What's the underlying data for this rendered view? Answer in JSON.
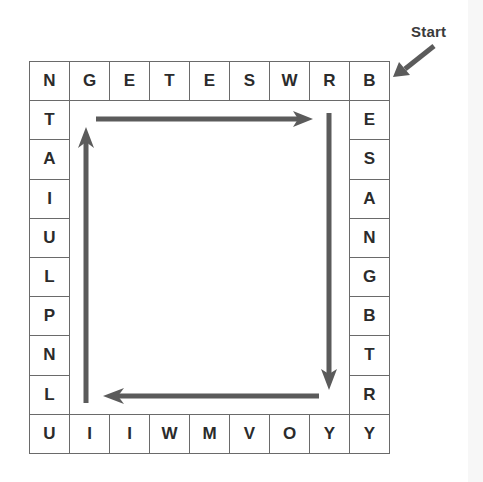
{
  "puzzle": {
    "start_label": "Start",
    "grid": {
      "columns": 9,
      "rows": 10,
      "origin_x": 29,
      "origin_y": 61,
      "cell_width": 40,
      "cell_height": 39.2
    },
    "top_row": [
      "N",
      "G",
      "E",
      "T",
      "E",
      "S",
      "W",
      "R",
      "B"
    ],
    "right_column": [
      "E",
      "S",
      "A",
      "N",
      "G",
      "B",
      "T",
      "R"
    ],
    "bottom_row": [
      "U",
      "I",
      "I",
      "W",
      "M",
      "V",
      "O",
      "Y",
      "Y"
    ],
    "left_column": [
      "T",
      "A",
      "I",
      "U",
      "L",
      "P",
      "N",
      "L"
    ],
    "direction": "clockwise",
    "arrows": [
      {
        "name": "arrow-right",
        "direction": "right"
      },
      {
        "name": "arrow-down",
        "direction": "down"
      },
      {
        "name": "arrow-left",
        "direction": "left"
      },
      {
        "name": "arrow-up",
        "direction": "up"
      }
    ],
    "colors": {
      "arrow": "#5b5b5b",
      "grid_line": "#6a6a6a",
      "letter": "#2b2b2b"
    }
  }
}
